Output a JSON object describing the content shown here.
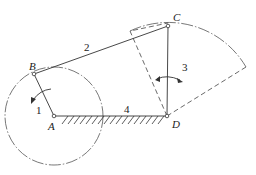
{
  "diagram": {
    "type": "four-bar linkage",
    "points": {
      "A": {
        "label": "A",
        "x": 54,
        "y": 116
      },
      "B": {
        "label": "B",
        "x": 34,
        "y": 74
      },
      "C": {
        "label": "C",
        "x": 168,
        "y": 26
      },
      "D": {
        "label": "D",
        "x": 167,
        "y": 116
      }
    },
    "links": [
      {
        "id": "1",
        "label": "1",
        "from": "A",
        "to": "B"
      },
      {
        "id": "2",
        "label": "2",
        "from": "B",
        "to": "C"
      },
      {
        "id": "3",
        "label": "3",
        "from": "D",
        "to": "C"
      },
      {
        "id": "4",
        "label": "4",
        "from": "A",
        "to": "D",
        "ground": true
      }
    ],
    "crank_circle": {
      "center": "A",
      "radius": 49,
      "style": "dash-dot"
    },
    "rocker_arc": {
      "center": "D",
      "radius": 90,
      "style": "dash-dot"
    },
    "extreme_positions": {
      "style": "dashed",
      "count": 2
    }
  }
}
